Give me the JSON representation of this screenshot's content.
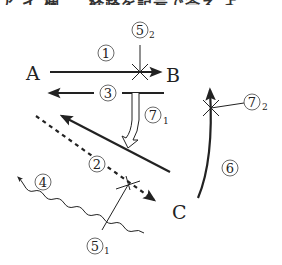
{
  "header": {
    "cut_off_text": "ア イ 欄 　 経路を記号で答え よ"
  },
  "points": {
    "A": "A",
    "B": "B",
    "C": "C"
  },
  "paths": [
    {
      "id": "1",
      "label": "①",
      "sub": "",
      "description": "A → B solid arrow"
    },
    {
      "id": "2",
      "label": "②",
      "sub": "",
      "description": "dotted arrow toward C"
    },
    {
      "id": "3",
      "label": "③",
      "sub": "",
      "description": "B → A solid arrow"
    },
    {
      "id": "4",
      "label": "④",
      "sub": "",
      "description": "wavy arrow up-left"
    },
    {
      "id": "5_1",
      "label": "⑤",
      "sub": "1",
      "description": "cross marker on path 2/4"
    },
    {
      "id": "5_2",
      "label": "⑤",
      "sub": "2",
      "description": "cross marker on path 1"
    },
    {
      "id": "6",
      "label": "⑥",
      "sub": "",
      "description": "curved arrow C → B"
    },
    {
      "id": "7_1",
      "label": "⑦",
      "sub": "1",
      "description": "hollow curved arrow from path 3 to diagonal line"
    },
    {
      "id": "7_2",
      "label": "⑦",
      "sub": "2",
      "description": "cross marker on path 6"
    }
  ],
  "colors": {
    "line": "#222222",
    "background": "#ffffff"
  }
}
